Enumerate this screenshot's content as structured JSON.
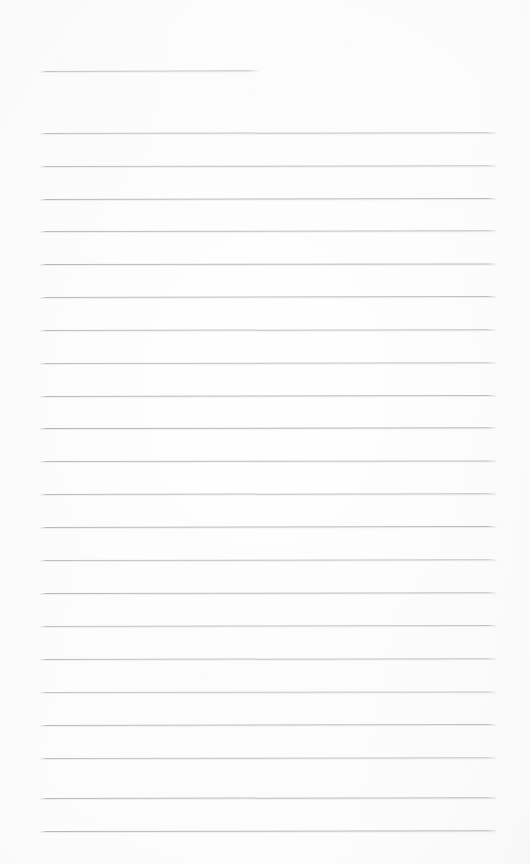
{
  "document": {
    "kind": "scanned-ruled-notebook-page",
    "title": "Blank Ruled Page",
    "description": "A blank scanned sheet of ruled notebook paper with horizontal rule lines and no handwriting or printed text.",
    "text_content": "",
    "page_width": 530,
    "page_height": 864,
    "background_color": "#fcfcfc",
    "rule_color": "#b9babe",
    "rule_color_light": "#cbccd0",
    "rule_thickness_px": 1,
    "rule_count": 23,
    "margin_left_px": 40,
    "margin_right_px": 497
  },
  "rules": [
    {
      "name": "rule-line-header",
      "index": 0,
      "x": 40,
      "y": 71,
      "width": 218,
      "tilt_deg": -0.18,
      "opacity": 0.8,
      "color": "#b4b5b9",
      "short": true
    },
    {
      "name": "rule-line-1",
      "index": 1,
      "x": 40,
      "y": 133,
      "width": 457,
      "tilt_deg": -0.1,
      "opacity": 0.85,
      "color": "#b7b8bc",
      "short": false
    },
    {
      "name": "rule-line-2",
      "index": 2,
      "x": 40,
      "y": 166,
      "width": 457,
      "tilt_deg": -0.08,
      "opacity": 0.86,
      "color": "#b6b7bb",
      "short": false
    },
    {
      "name": "rule-line-3",
      "index": 3,
      "x": 40,
      "y": 199,
      "width": 457,
      "tilt_deg": -0.12,
      "opacity": 0.9,
      "color": "#b2b3b7",
      "short": false
    },
    {
      "name": "rule-line-4",
      "index": 4,
      "x": 40,
      "y": 231,
      "width": 457,
      "tilt_deg": -0.09,
      "opacity": 0.88,
      "color": "#b4b5b9",
      "short": false
    },
    {
      "name": "rule-line-5",
      "index": 5,
      "x": 40,
      "y": 264,
      "width": 457,
      "tilt_deg": -0.07,
      "opacity": 0.9,
      "color": "#b1b2b6",
      "short": false
    },
    {
      "name": "rule-line-6",
      "index": 6,
      "x": 40,
      "y": 297,
      "width": 457,
      "tilt_deg": -0.11,
      "opacity": 0.88,
      "color": "#b3b4b8",
      "short": false
    },
    {
      "name": "rule-line-7",
      "index": 7,
      "x": 40,
      "y": 330,
      "width": 457,
      "tilt_deg": -0.1,
      "opacity": 0.87,
      "color": "#b5b6ba",
      "short": false
    },
    {
      "name": "rule-line-8",
      "index": 8,
      "x": 40,
      "y": 363,
      "width": 457,
      "tilt_deg": -0.08,
      "opacity": 0.86,
      "color": "#b6b7bb",
      "short": false
    },
    {
      "name": "rule-line-9",
      "index": 9,
      "x": 40,
      "y": 396,
      "width": 457,
      "tilt_deg": -0.12,
      "opacity": 0.89,
      "color": "#b2b3b7",
      "short": false
    },
    {
      "name": "rule-line-10",
      "index": 10,
      "x": 40,
      "y": 428,
      "width": 457,
      "tilt_deg": -0.09,
      "opacity": 0.92,
      "color": "#aeafb4",
      "short": false
    },
    {
      "name": "rule-line-11",
      "index": 11,
      "x": 40,
      "y": 461,
      "width": 457,
      "tilt_deg": -0.07,
      "opacity": 0.88,
      "color": "#b3b4b8",
      "short": false
    },
    {
      "name": "rule-line-12",
      "index": 12,
      "x": 40,
      "y": 494,
      "width": 457,
      "tilt_deg": -0.1,
      "opacity": 0.87,
      "color": "#b4b5b9",
      "short": false
    },
    {
      "name": "rule-line-13",
      "index": 13,
      "x": 40,
      "y": 527,
      "width": 457,
      "tilt_deg": -0.11,
      "opacity": 0.9,
      "color": "#b1b2b6",
      "short": false
    },
    {
      "name": "rule-line-14",
      "index": 14,
      "x": 40,
      "y": 560,
      "width": 457,
      "tilt_deg": -0.08,
      "opacity": 0.86,
      "color": "#b6b7bb",
      "short": false
    },
    {
      "name": "rule-line-15",
      "index": 15,
      "x": 40,
      "y": 593,
      "width": 457,
      "tilt_deg": -0.09,
      "opacity": 0.88,
      "color": "#b3b4b8",
      "short": false
    },
    {
      "name": "rule-line-16",
      "index": 16,
      "x": 40,
      "y": 626,
      "width": 457,
      "tilt_deg": -0.12,
      "opacity": 0.85,
      "color": "#b7b8bc",
      "short": false
    },
    {
      "name": "rule-line-17",
      "index": 17,
      "x": 40,
      "y": 659,
      "width": 457,
      "tilt_deg": -0.1,
      "opacity": 0.87,
      "color": "#b5b6ba",
      "short": false
    },
    {
      "name": "rule-line-18",
      "index": 18,
      "x": 40,
      "y": 692,
      "width": 457,
      "tilt_deg": -0.07,
      "opacity": 0.84,
      "color": "#b8b9bd",
      "short": false
    },
    {
      "name": "rule-line-19",
      "index": 19,
      "x": 40,
      "y": 725,
      "width": 457,
      "tilt_deg": -0.11,
      "opacity": 0.88,
      "color": "#b3b4b8",
      "short": false
    },
    {
      "name": "rule-line-20",
      "index": 20,
      "x": 40,
      "y": 758,
      "width": 457,
      "tilt_deg": -0.09,
      "opacity": 0.86,
      "color": "#b6b7bb",
      "short": false
    },
    {
      "name": "rule-line-21",
      "index": 21,
      "x": 40,
      "y": 798,
      "width": 457,
      "tilt_deg": -0.1,
      "opacity": 0.89,
      "color": "#b2b3b7",
      "short": false
    },
    {
      "name": "rule-line-22",
      "index": 22,
      "x": 40,
      "y": 831,
      "width": 457,
      "tilt_deg": -0.08,
      "opacity": 0.9,
      "color": "#b1b2b6",
      "short": false
    }
  ]
}
